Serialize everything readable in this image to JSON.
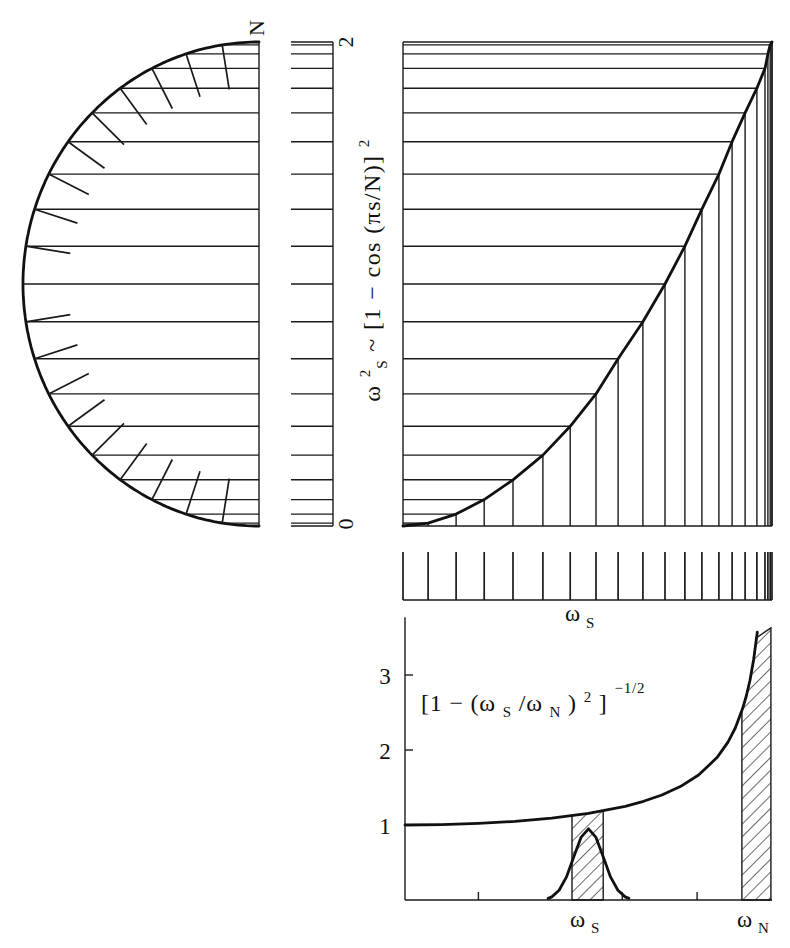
{
  "figure": {
    "semicircle": {
      "top_label": "N"
    },
    "scale_bar": {
      "top_tick_label": "2",
      "bottom_tick_label": "0"
    },
    "dispersion_plot": {
      "ylabel": {
        "omega": "ω",
        "sup": "2",
        "sub": "S",
        "rest": " ~ [1 − cos (πs/N)]",
        "rest_sup": "2"
      }
    },
    "tick_bar": {
      "xlabel": {
        "omega": "ω",
        "sub": "S"
      }
    },
    "amplitude_plot": {
      "yticks": [
        "3",
        "2",
        "1"
      ],
      "formula": {
        "open": "[1 − (ω",
        "sub1": "S",
        "mid": "/ω",
        "sub2": "N",
        "close": ")",
        "sup": "2",
        "bracket": "]",
        "exp": "−1/2"
      },
      "xlabels": {
        "ws": {
          "omega": "ω",
          "sub": "S"
        },
        "wn": {
          "omega": "ω",
          "sub": "N"
        }
      }
    }
  },
  "chart_data": [
    {
      "id": "semicircle_projection",
      "type": "scatter",
      "title": "",
      "annotation": "N",
      "N": 20,
      "radial_tick_indices": [
        1,
        2,
        3,
        4,
        5,
        6,
        7,
        8,
        9,
        11,
        12,
        13,
        14,
        15,
        16,
        17,
        18,
        19
      ],
      "s": [
        0,
        1,
        2,
        3,
        4,
        5,
        6,
        7,
        8,
        9,
        10,
        11,
        12,
        13,
        14,
        15,
        16,
        17,
        18,
        19,
        20
      ],
      "x": [
        0,
        -0.156,
        -0.309,
        -0.454,
        -0.588,
        -0.707,
        -0.809,
        -0.891,
        -0.951,
        -0.988,
        -1,
        -0.988,
        -0.951,
        -0.891,
        -0.809,
        -0.707,
        -0.588,
        -0.454,
        -0.309,
        -0.156,
        0
      ],
      "y": [
        2,
        1.988,
        1.951,
        1.891,
        1.809,
        1.707,
        1.588,
        1.454,
        1.309,
        1.156,
        1,
        0.844,
        0.691,
        0.546,
        0.412,
        0.293,
        0.191,
        0.109,
        0.049,
        0.012,
        0
      ]
    },
    {
      "id": "dispersion",
      "type": "line",
      "title": "",
      "xlabel": "ω_S",
      "ylabel": "ω_S² ~ [1 − cos (πs/N)]²",
      "yticks": [
        0,
        2
      ],
      "ylim": [
        0,
        2
      ],
      "xlim": [
        0,
        1
      ],
      "grid": false,
      "x": [
        0,
        0.068,
        0.144,
        0.22,
        0.298,
        0.379,
        0.453,
        0.523,
        0.583,
        0.65,
        0.71,
        0.764,
        0.81,
        0.856,
        0.892,
        0.927,
        0.959,
        0.981,
        0.989,
        0.995,
        1
      ],
      "y": [
        0,
        0.012,
        0.049,
        0.109,
        0.191,
        0.293,
        0.412,
        0.546,
        0.691,
        0.844,
        1,
        1.156,
        1.309,
        1.454,
        1.588,
        1.707,
        1.809,
        1.891,
        1.951,
        1.988,
        2
      ]
    },
    {
      "id": "frequency_ticks",
      "type": "scatter",
      "title": "",
      "xlabel": "ω_S",
      "xlim": [
        0,
        1
      ],
      "tick_positions": [
        0,
        0.068,
        0.144,
        0.22,
        0.298,
        0.379,
        0.453,
        0.523,
        0.583,
        0.65,
        0.71,
        0.764,
        0.81,
        0.856,
        0.892,
        0.927,
        0.959,
        0.981,
        0.989,
        0.995,
        1
      ]
    },
    {
      "id": "amplitude",
      "type": "line",
      "title": "",
      "xlabel": "",
      "ylabel": "",
      "yticks": [
        1,
        2,
        3
      ],
      "ylim": [
        0,
        3.77
      ],
      "xlim": [
        0,
        1
      ],
      "grid": false,
      "xtick_labels": [
        {
          "label": "ω_S",
          "x": 0.5
        },
        {
          "label": "ω_N",
          "x": 0.955
        }
      ],
      "minor_xticks": [
        0.2,
        0.592,
        0.796
      ],
      "annotation": "[1 − (ω_S/ω_N)²]^−1/2",
      "hatched_bands": [
        {
          "from": 0.455,
          "to": 0.54,
          "top": "curve"
        },
        {
          "from": 0.918,
          "to": 0.997,
          "top": 3.63
        }
      ],
      "series": [
        {
          "name": "[1 − (ω_S/ω_N)²]^−1/2",
          "x": [
            0,
            0.1,
            0.2,
            0.3,
            0.4,
            0.5,
            0.6,
            0.65,
            0.7,
            0.75,
            0.8,
            0.85,
            0.88,
            0.9,
            0.92,
            0.93,
            0.94,
            0.95,
            0.96
          ],
          "y": [
            1,
            1.005,
            1.021,
            1.048,
            1.091,
            1.155,
            1.25,
            1.316,
            1.4,
            1.512,
            1.667,
            1.898,
            2.105,
            2.294,
            2.552,
            2.72,
            2.931,
            3.203,
            3.571
          ]
        },
        {
          "name": "peak",
          "x": [
            0.39,
            0.4,
            0.42,
            0.44,
            0.46,
            0.48,
            0.5,
            0.52,
            0.54,
            0.56,
            0.58,
            0.6,
            0.61
          ],
          "y": [
            0.022,
            0.042,
            0.129,
            0.308,
            0.576,
            0.838,
            0.95,
            0.838,
            0.576,
            0.308,
            0.129,
            0.042,
            0.022
          ]
        }
      ]
    }
  ]
}
